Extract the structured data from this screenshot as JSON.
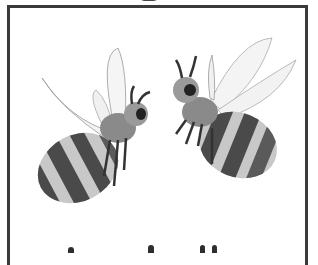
{
  "image": {
    "description": "Two cartoon bees facing each other inside a rectangular frame",
    "subjects": [
      {
        "name": "left-bee",
        "facing": "right",
        "stripes": 4
      },
      {
        "name": "right-bee",
        "facing": "left",
        "stripes": 4
      }
    ],
    "colors": {
      "border": "#3a3a3a",
      "stripe_dark": "#4a4a4a",
      "stripe_light": "#c8c8c8",
      "wing": "#f2f2f2",
      "background": "#ffffff"
    }
  }
}
